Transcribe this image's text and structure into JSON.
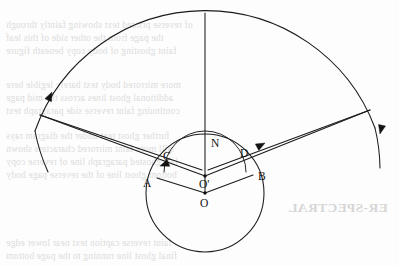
{
  "figure": {
    "canvas": {
      "width": 399,
      "height": 266,
      "background": "#fdfdfd"
    },
    "ink_color": "#1a1a1a",
    "labels": {
      "normal": "N",
      "point_a": "A",
      "point_b": "B",
      "point_c": "C",
      "point_d": "D",
      "center_outer": "O",
      "center_inner": "O'"
    },
    "geometry": {
      "outer_arc": {
        "center_x": 205,
        "center_y": 193,
        "radius": 181,
        "start_angle_deg": 200,
        "end_angle_deg": 340,
        "description": "large outer arc spanning top of figure"
      },
      "big_circle": {
        "center_x": 205,
        "center_y": 193,
        "radius": 59
      },
      "small_arc": {
        "center_x": 205,
        "center_y": 175,
        "radius": 41,
        "description": "arc through C and D centred on O-prime"
      },
      "normal_line": {
        "x": 205,
        "y_top": 13,
        "y_bottom": 176
      },
      "left_node": {
        "x": 40,
        "y": 115
      },
      "right_node": {
        "x": 370,
        "y": 110
      },
      "point_a": {
        "x": 157,
        "y": 178
      },
      "point_b": {
        "x": 253,
        "y": 175
      },
      "point_c": {
        "x": 172,
        "y": 163
      },
      "point_d": {
        "x": 239,
        "y": 160
      },
      "center_outer": {
        "x": 205,
        "y": 193
      },
      "center_inner": {
        "x": 205,
        "y": 175
      }
    },
    "arrowheads": [
      {
        "name": "left-arc-arrow",
        "x": 49,
        "y": 95,
        "angle_deg": -66,
        "on": "outer-arc"
      },
      {
        "name": "right-arc-arrow",
        "x": 378,
        "y": 130,
        "angle_deg": 104,
        "on": "outer-arc"
      },
      {
        "name": "ray-arrow-toward-c",
        "x": 166,
        "y": 166,
        "angle_deg": 22,
        "on": "incident-ray-left"
      },
      {
        "name": "ray-arrow-from-d",
        "x": 253,
        "y": 148,
        "angle_deg": -28,
        "on": "emergent-ray-right"
      }
    ]
  },
  "bleed_through": {
    "note": "faint mirrored text showing through from reverse of page",
    "lines": [
      {
        "text": "of reverse printed text showing faintly through",
        "x": 6,
        "y": 20,
        "size": 9.5
      },
      {
        "text": "the page from the other side of this leaf",
        "x": 6,
        "y": 33,
        "size": 9.5
      },
      {
        "text": "faint ghosting of body copy beneath figure",
        "x": 6,
        "y": 46,
        "size": 9.5
      },
      {
        "text": "more mirrored body text barely legible here",
        "x": 6,
        "y": 80,
        "size": 9.5
      },
      {
        "text": "additional ghost lines across the mid page",
        "x": 6,
        "y": 93,
        "size": 9.5
      },
      {
        "text": "continuing faint reverse side paragraph text",
        "x": 6,
        "y": 106,
        "size": 9.5
      },
      {
        "text": "further ghost text under the diagram rays",
        "x": 6,
        "y": 131,
        "size": 9.5
      },
      {
        "text": "still more faint mirrored characters shown",
        "x": 6,
        "y": 144,
        "size": 9.5
      },
      {
        "text": "last ghosted paragraph line of reverse copy",
        "x": 6,
        "y": 157,
        "size": 9.5
      },
      {
        "text": "bottom ghost line of the reverse page body",
        "x": 6,
        "y": 170,
        "size": 9.5
      },
      {
        "text": "faint reverse caption text near lower edge",
        "x": 6,
        "y": 238,
        "size": 9.5
      },
      {
        "text": "final ghost line running to the page bottom",
        "x": 6,
        "y": 251,
        "size": 9.5
      }
    ],
    "heading": {
      "text": "ER-SPECTRAL",
      "x": 288,
      "y": 200,
      "size": 13.5
    }
  }
}
